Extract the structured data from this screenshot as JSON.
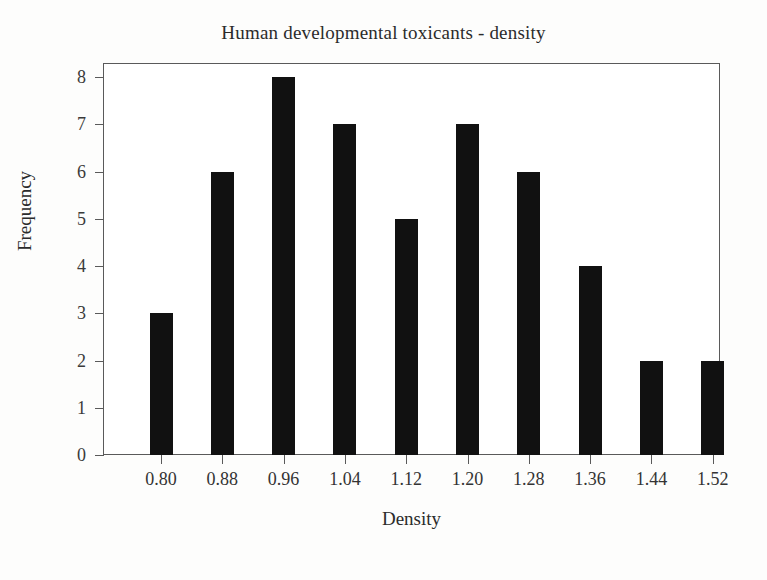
{
  "chart_data": {
    "type": "bar",
    "title": "Human developmental toxicants - density",
    "xlabel": "Density",
    "ylabel": "Frequency",
    "categories": [
      "0.80",
      "0.88",
      "0.96",
      "1.04",
      "1.12",
      "1.20",
      "1.28",
      "1.36",
      "1.44",
      "1.52"
    ],
    "values": [
      3,
      6,
      8,
      7,
      5,
      7,
      6,
      4,
      2,
      2
    ],
    "xtick_labels": [
      "0.80",
      "0.88",
      "0.96",
      "1.04",
      "1.12",
      "1.20",
      "1.28",
      "1.36",
      "1.44",
      "1.52"
    ],
    "ytick_labels": [
      "0",
      "1",
      "2",
      "3",
      "4",
      "5",
      "6",
      "7",
      "8"
    ],
    "ytick_values": [
      0,
      1,
      2,
      3,
      4,
      5,
      6,
      7,
      8
    ],
    "ylim": [
      0,
      8.3
    ],
    "grid": false,
    "legend": null,
    "bar_color": "#111111",
    "axis_color": "#5a5a5a",
    "background_color": "#ffffff"
  }
}
